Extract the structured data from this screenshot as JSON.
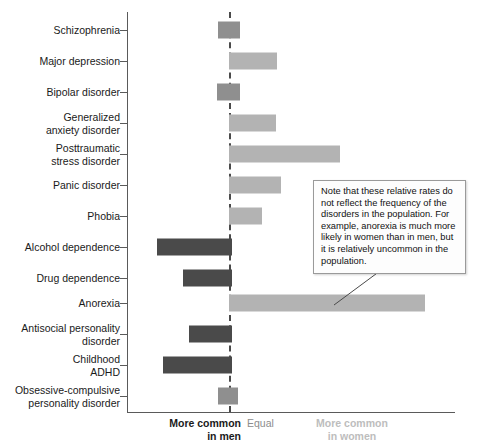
{
  "chart_data": {
    "type": "bar",
    "orientation": "horizontal-diverging",
    "title": "",
    "subtitle": "",
    "xlabel": "",
    "ylabel": "",
    "grid": false,
    "legend_position": "below-axis",
    "axis_origin_label": "Equal",
    "axis_left_label": "More common\nin men",
    "axis_right_label": "More common\nin women",
    "xlim": [
      -1.45,
      3.8
    ],
    "note": "Values are relative rates; negative = more common in men, positive = more common in women, 0 = equal.",
    "categories": [
      "Schizophrenia",
      "Major depression",
      "Bipolar disorder",
      "Generalized anxiety disorder",
      "Posttraumatic stress disorder",
      "Panic disorder",
      "Phobia",
      "Alcohol dependence",
      "Drug dependence",
      "Anorexia",
      "Antisocial personality disorder",
      "Childhood ADHD",
      "Obsessive-compulsive personality disorder"
    ],
    "values": [
      0.2,
      0.9,
      0.2,
      0.9,
      2.1,
      1.0,
      0.6,
      -1.4,
      -0.9,
      3.7,
      -0.8,
      -1.25,
      0.17
    ],
    "bars": [
      {
        "label": "Schizophrenia",
        "label_lines": [
          "Schizophrenia"
        ],
        "start": -0.21,
        "end": 0.21,
        "value": 0.2,
        "color_key": "mixed",
        "row_y": 30
      },
      {
        "label": "Major depression",
        "label_lines": [
          "Major depression"
        ],
        "start": 0,
        "end": 0.91,
        "value": 0.9,
        "color_key": "women",
        "row_y": 61
      },
      {
        "label": "Bipolar disorder",
        "label_lines": [
          "Bipolar disorder"
        ],
        "start": -0.23,
        "end": 0.21,
        "value": 0.2,
        "color_key": "mixed",
        "row_y": 92
      },
      {
        "label": "Generalized anxiety disorder",
        "label_lines": [
          "Generalized",
          "anxiety disorder"
        ],
        "start": 0,
        "end": 0.89,
        "value": 0.9,
        "color_key": "women",
        "row_y": 123
      },
      {
        "label": "Posttraumatic stress disorder",
        "label_lines": [
          "Posttraumatic",
          "stress disorder"
        ],
        "start": 0,
        "end": 2.1,
        "value": 2.1,
        "color_key": "women",
        "row_y": 154
      },
      {
        "label": "Panic disorder",
        "label_lines": [
          "Panic disorder"
        ],
        "start": 0,
        "end": 0.98,
        "value": 1.0,
        "color_key": "women",
        "row_y": 185
      },
      {
        "label": "Phobia",
        "label_lines": [
          "Phobia"
        ],
        "start": 0,
        "end": 0.62,
        "value": 0.6,
        "color_key": "women",
        "row_y": 216
      },
      {
        "label": "Alcohol dependence",
        "label_lines": [
          "Alcohol dependence"
        ],
        "start": -1.36,
        "end": 0.06,
        "value": -1.4,
        "color_key": "men",
        "row_y": 247
      },
      {
        "label": "Drug dependence",
        "label_lines": [
          "Drug dependence"
        ],
        "start": -0.87,
        "end": 0.06,
        "value": -0.9,
        "color_key": "men",
        "row_y": 278
      },
      {
        "label": "Anorexia",
        "label_lines": [
          "Anorexia"
        ],
        "start": 0,
        "end": 3.7,
        "value": 3.7,
        "color_key": "women",
        "row_y": 303
      },
      {
        "label": "Antisocial personality disorder",
        "label_lines": [
          "Antisocial personality",
          "disorder"
        ],
        "start": -0.75,
        "end": 0.06,
        "value": -0.8,
        "color_key": "men",
        "row_y": 334
      },
      {
        "label": "Childhood ADHD",
        "label_lines": [
          "Childhood",
          "ADHD"
        ],
        "start": -1.25,
        "end": 0.06,
        "value": -1.25,
        "color_key": "men",
        "row_y": 365
      },
      {
        "label": "Obsessive-compulsive personality disorder",
        "label_lines": [
          "Obsessive-compulsive",
          "personality disorder"
        ],
        "start": -0.21,
        "end": 0.17,
        "value": 0.17,
        "color_key": "mixed",
        "row_y": 396
      }
    ],
    "colors": {
      "men": "#4a4a4a",
      "women": "#b3b3b3",
      "mixed": "#8f8f8f",
      "axis": "#5a5a5a",
      "equal_line": "#4a4a4a",
      "label_men": "#1a1a1a",
      "label_equal": "#8c8c8c",
      "label_women": "#bdbdbd"
    }
  },
  "annotation": {
    "text": "Note that these relative rates do not reflect the frequency of the disorders in the population. For example, anorexia is much more likely in women than in men, but it is relatively uncommon in the population."
  },
  "axis_legend": {
    "men_line1": "More common",
    "men_line2": "in men",
    "equal": "Equal",
    "women_line1": "More common",
    "women_line2": "in women"
  }
}
